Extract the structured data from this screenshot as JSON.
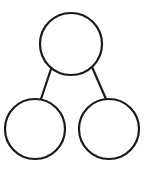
{
  "diagram": {
    "type": "tree",
    "stroke_color": "#1a1a1a",
    "fill_color": "#ffffff",
    "nodes": [
      {
        "id": "root",
        "label": "",
        "cx": 71,
        "cy": 44,
        "r": 31
      },
      {
        "id": "left-child",
        "label": "",
        "cx": 35,
        "cy": 129,
        "r": 30
      },
      {
        "id": "right-child",
        "label": "",
        "cx": 109,
        "cy": 129,
        "r": 30
      }
    ],
    "edges": [
      {
        "from": "root",
        "to": "left-child",
        "x1": 51,
        "y1": 69,
        "x2": 41,
        "y2": 99
      },
      {
        "from": "root",
        "to": "right-child",
        "x1": 92,
        "y1": 67,
        "x2": 106,
        "y2": 99
      }
    ]
  }
}
